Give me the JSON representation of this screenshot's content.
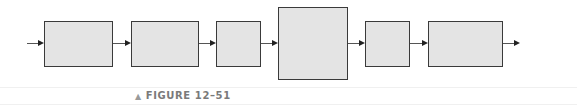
{
  "diagram": {
    "type": "block-diagram",
    "blocks": [
      {
        "id": 1,
        "left": 44,
        "top": 21,
        "width": 69,
        "height": 46,
        "label": ""
      },
      {
        "id": 2,
        "left": 131,
        "top": 21,
        "width": 68,
        "height": 46,
        "label": ""
      },
      {
        "id": 3,
        "left": 216,
        "top": 21,
        "width": 45,
        "height": 46,
        "label": ""
      },
      {
        "id": 4,
        "left": 278,
        "top": 7,
        "width": 70,
        "height": 73,
        "label": ""
      },
      {
        "id": 5,
        "left": 365,
        "top": 21,
        "width": 45,
        "height": 46,
        "label": ""
      },
      {
        "id": 6,
        "left": 428,
        "top": 21,
        "width": 75,
        "height": 46,
        "label": ""
      }
    ],
    "arrows": [
      {
        "from": "input",
        "to": 1
      },
      {
        "from": 1,
        "to": 2
      },
      {
        "from": 2,
        "to": 3
      },
      {
        "from": 3,
        "to": 4
      },
      {
        "from": 4,
        "to": 5
      },
      {
        "from": 5,
        "to": 6
      },
      {
        "from": 6,
        "to": "output"
      }
    ],
    "colors": {
      "block_fill": "#e4e4e4",
      "block_border": "#3a3a3a",
      "arrow": "#222222",
      "caption": "#7a7a7a"
    }
  },
  "caption": {
    "marker": "▲",
    "text": "FIGURE 12–51"
  }
}
